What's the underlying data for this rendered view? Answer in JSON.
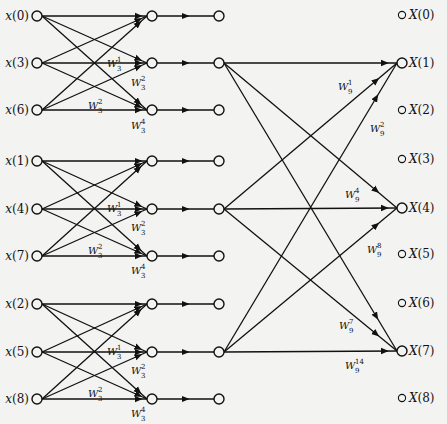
{
  "diagram": {
    "inputs": [
      "x(0)",
      "x(3)",
      "x(6)",
      "x(1)",
      "x(4)",
      "x(7)",
      "x(2)",
      "x(5)",
      "x(8)"
    ],
    "outputs": [
      "X(0)",
      "X(1)",
      "X(2)",
      "X(3)",
      "X(4)",
      "X(5)",
      "X(6)",
      "X(7)",
      "X(8)"
    ],
    "stage1_twiddles": [
      {
        "base": "W",
        "sub": "3",
        "sup": "1"
      },
      {
        "base": "W",
        "sub": "3",
        "sup": "2"
      },
      {
        "base": "W",
        "sub": "3",
        "sup": "2"
      },
      {
        "base": "W",
        "sub": "3",
        "sup": "4"
      }
    ],
    "stage2_twiddles": [
      {
        "base": "W",
        "sub": "9",
        "sup": "1"
      },
      {
        "base": "W",
        "sub": "9",
        "sup": "2"
      },
      {
        "base": "W",
        "sub": "9",
        "sup": "4"
      },
      {
        "base": "W",
        "sub": "9",
        "sup": "8"
      },
      {
        "base": "W",
        "sub": "9",
        "sup": "7"
      },
      {
        "base": "W",
        "sub": "9",
        "sup": "14"
      }
    ]
  }
}
